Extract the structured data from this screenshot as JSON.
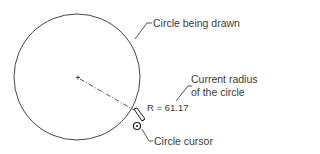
{
  "labels": {
    "circle_being_drawn": "Circle being drawn",
    "current_radius_line1": "Current radius",
    "current_radius_line2": "of the circle",
    "radius_value": "R = 61.17",
    "circle_cursor": "Circle cursor"
  },
  "drawing": {
    "center": [
      77,
      77
    ],
    "radius": 63,
    "stroke_color": "#333333"
  }
}
